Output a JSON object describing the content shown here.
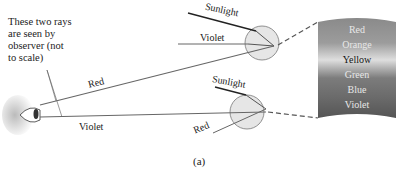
{
  "diagram": {
    "note": [
      "These two rays",
      "are seen by",
      "observer (not",
      "to scale)"
    ],
    "caption": "(a)",
    "upper_drop": {
      "sunlight_label": "Sunlight",
      "exit_label": "Violet"
    },
    "lower_drop": {
      "sunlight_label": "Sunlight",
      "exit_label": "Red"
    },
    "observer_rays": {
      "upper": "Red",
      "lower": "Violet"
    },
    "rainbow_band": {
      "colors": [
        "Red",
        "Orange",
        "Yellow",
        "Green",
        "Blue",
        "Violet"
      ],
      "gradient": [
        "#8a8a8a",
        "#9a9a9a",
        "#d8d8d8",
        "#7a7a7a",
        "#6e6e6e",
        "#5a5a5a"
      ]
    }
  }
}
